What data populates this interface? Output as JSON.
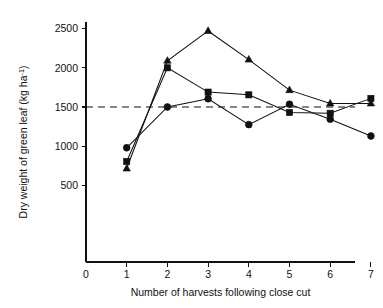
{
  "chart_data": {
    "type": "line",
    "title": "",
    "xlabel": "Number of harvests following close cut",
    "ylabel": "Dry weight of green leaf (kg ha",
    "ylabel_superscript": "-1",
    "ylabel_suffix": ")",
    "x": [
      1,
      2,
      3,
      4,
      5,
      6,
      7
    ],
    "xlim": [
      0,
      7.35
    ],
    "ylim": [
      0,
      2680
    ],
    "xticks": [
      0,
      1,
      2,
      3,
      4,
      5,
      6,
      7
    ],
    "xtick_labels": [
      "0",
      "1",
      "2",
      "3",
      "4",
      "5",
      "6",
      "7"
    ],
    "yticks": [
      500,
      1000,
      1500,
      2000,
      2500
    ],
    "ytick_labels": [
      "500",
      "1000",
      "1500",
      "2000",
      "2500"
    ],
    "grid": false,
    "legend": "none",
    "reference_line": {
      "value": 1500,
      "style": "dashed",
      "label": ""
    },
    "series": [
      {
        "name": "triangle-series",
        "marker": "triangle",
        "values": [
          715,
          2090,
          2470,
          2105,
          1715,
          1545,
          1545
        ]
      },
      {
        "name": "square-series",
        "marker": "square",
        "values": [
          805,
          2000,
          1690,
          1655,
          1430,
          1420,
          1610
        ]
      },
      {
        "name": "circle-series",
        "marker": "circle",
        "values": [
          980,
          1500,
          1605,
          1275,
          1535,
          1345,
          1130
        ]
      }
    ],
    "colors": {
      "axis": "#111111",
      "line": "#111111",
      "marker": "#111111",
      "reference_line": "#111111",
      "background": "#ffffff"
    }
  }
}
